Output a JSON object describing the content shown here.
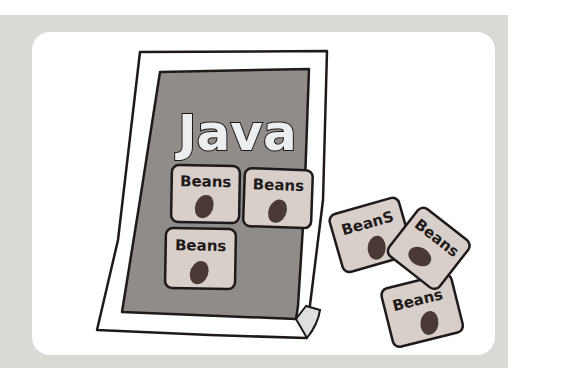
{
  "illustration": {
    "title": "Java",
    "cards_on_sheet": [
      {
        "label": "Beans"
      },
      {
        "label": "Beans"
      },
      {
        "label": "Beans"
      }
    ],
    "loose_cards": [
      {
        "label": "BeanS"
      },
      {
        "label": "Beans"
      },
      {
        "label": "Beans"
      }
    ]
  },
  "colors": {
    "band": "#d9dad6",
    "card": "#ffffff",
    "sheet": "#ffffff",
    "panel": "#8f8c89",
    "bean_card": "#d8cfcb",
    "bean": "#4a3a36",
    "outline": "#1f1a18"
  }
}
